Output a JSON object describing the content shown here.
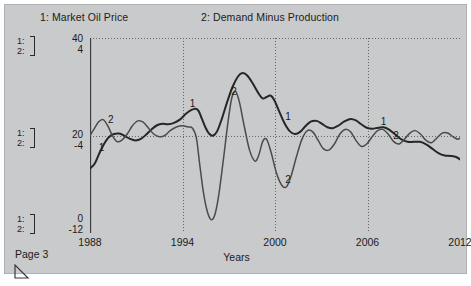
{
  "window": {
    "page_label": "Page 3",
    "resize_grip_icon": "resize-corner-icon",
    "background_color": "#c9cacb"
  },
  "legend": [
    {
      "key": "1",
      "label": "1: Market Oil Price"
    },
    {
      "key": "2",
      "label": "2: Demand Minus Production"
    }
  ],
  "scale_brackets": [
    {
      "line1": "1:",
      "line2": "2:"
    },
    {
      "line1": "1:",
      "line2": "2:"
    },
    {
      "line1": "1:",
      "line2": "2:"
    }
  ],
  "axis_values": {
    "top": {
      "scale1": "40",
      "scale2": "4"
    },
    "mid": {
      "scale1": "20",
      "scale2": "-4"
    },
    "bottom": {
      "scale1": "0",
      "scale2": "-12"
    }
  },
  "chart_data": {
    "type": "line",
    "title": "",
    "xlabel": "Years",
    "ylabel": "",
    "grid": true,
    "legend_position": "top",
    "x": [
      1988,
      2012
    ],
    "xlim": [
      1988,
      2012
    ],
    "xticks": [
      "1988",
      "1994",
      "2000",
      "2006",
      "2012"
    ],
    "xtick_values": [
      1988,
      1994,
      2000,
      2006,
      2012
    ],
    "axes": [
      {
        "id": "1",
        "name": "Market Oil Price",
        "ylim": [
          0,
          40
        ],
        "yticks": [
          0,
          20,
          40
        ],
        "ytick_labels": [
          "0",
          "20",
          "40"
        ],
        "color": "#262626"
      },
      {
        "id": "2",
        "name": "Demand Minus Production",
        "ylim": [
          -12,
          4
        ],
        "yticks": [
          -12,
          -4,
          4
        ],
        "ytick_labels": [
          "-12",
          "-4",
          "4"
        ],
        "color": "#4b4b4b"
      }
    ],
    "series": [
      {
        "name": "Market Oil Price",
        "key": "1",
        "axis": "1",
        "inline_tag": "1",
        "tag_positions_x": [
          1988.5,
          1994.4,
          2000.6,
          2006.8
        ],
        "points": [
          [
            1988.0,
            13.2
          ],
          [
            1988.3,
            14.2
          ],
          [
            1988.6,
            16.3
          ],
          [
            1988.9,
            18.2
          ],
          [
            1989.2,
            19.6
          ],
          [
            1989.55,
            20.3
          ],
          [
            1989.9,
            20.4
          ],
          [
            1990.25,
            19.9
          ],
          [
            1990.6,
            19.3
          ],
          [
            1990.95,
            19.0
          ],
          [
            1991.3,
            19.3
          ],
          [
            1991.65,
            20.2
          ],
          [
            1992.0,
            21.3
          ],
          [
            1992.35,
            22.1
          ],
          [
            1992.7,
            22.4
          ],
          [
            1993.05,
            22.3
          ],
          [
            1993.45,
            22.6
          ],
          [
            1993.85,
            23.3
          ],
          [
            1994.2,
            24.4
          ],
          [
            1994.55,
            25.2
          ],
          [
            1994.85,
            25.5
          ],
          [
            1995.05,
            25.0
          ],
          [
            1995.25,
            23.5
          ],
          [
            1995.5,
            21.6
          ],
          [
            1995.75,
            20.3
          ],
          [
            1996.0,
            20.0
          ],
          [
            1996.25,
            20.9
          ],
          [
            1996.55,
            23.4
          ],
          [
            1996.9,
            26.9
          ],
          [
            1997.25,
            30.0
          ],
          [
            1997.6,
            32.1
          ],
          [
            1997.9,
            32.8
          ],
          [
            1998.2,
            32.3
          ],
          [
            1998.55,
            30.7
          ],
          [
            1998.9,
            28.8
          ],
          [
            1999.2,
            27.6
          ],
          [
            1999.45,
            27.9
          ],
          [
            1999.7,
            28.2
          ],
          [
            1999.95,
            27.3
          ],
          [
            2000.25,
            25.1
          ],
          [
            2000.6,
            22.6
          ],
          [
            2000.95,
            20.9
          ],
          [
            2001.3,
            20.3
          ],
          [
            2001.65,
            20.8
          ],
          [
            2002.0,
            22.0
          ],
          [
            2002.35,
            22.9
          ],
          [
            2002.7,
            23.0
          ],
          [
            2003.05,
            22.4
          ],
          [
            2003.4,
            21.7
          ],
          [
            2003.75,
            21.5
          ],
          [
            2004.1,
            22.0
          ],
          [
            2004.5,
            22.9
          ],
          [
            2004.9,
            23.4
          ],
          [
            2005.25,
            23.1
          ],
          [
            2005.6,
            22.3
          ],
          [
            2005.95,
            21.6
          ],
          [
            2006.3,
            21.4
          ],
          [
            2006.7,
            21.6
          ],
          [
            2007.05,
            21.7
          ],
          [
            2007.4,
            21.2
          ],
          [
            2007.8,
            20.2
          ],
          [
            2008.2,
            19.2
          ],
          [
            2008.6,
            18.7
          ],
          [
            2009.0,
            18.7
          ],
          [
            2009.4,
            18.7
          ],
          [
            2009.8,
            18.2
          ],
          [
            2010.2,
            17.3
          ],
          [
            2010.6,
            16.4
          ],
          [
            2011.0,
            15.9
          ],
          [
            2011.4,
            15.8
          ],
          [
            2011.75,
            15.6
          ],
          [
            2012.0,
            15.1
          ]
        ]
      },
      {
        "name": "Demand Minus Production",
        "key": "2",
        "axis": "2",
        "inline_tag": "2",
        "tag_positions_x": [
          1989.1,
          1997.1,
          2000.6,
          2007.6
        ],
        "points": [
          [
            1988.0,
            -4.0
          ],
          [
            1988.25,
            -3.5
          ],
          [
            1988.55,
            -2.9
          ],
          [
            1988.85,
            -2.7
          ],
          [
            1989.15,
            -3.2
          ],
          [
            1989.45,
            -4.0
          ],
          [
            1989.75,
            -4.5
          ],
          [
            1990.05,
            -4.4
          ],
          [
            1990.4,
            -3.9
          ],
          [
            1990.75,
            -3.2
          ],
          [
            1991.1,
            -2.8
          ],
          [
            1991.45,
            -2.9
          ],
          [
            1991.8,
            -3.4
          ],
          [
            1992.15,
            -3.9
          ],
          [
            1992.5,
            -4.1
          ],
          [
            1992.85,
            -4.0
          ],
          [
            1993.2,
            -3.6
          ],
          [
            1993.6,
            -3.3
          ],
          [
            1994.0,
            -3.2
          ],
          [
            1994.35,
            -3.3
          ],
          [
            1994.65,
            -3.4
          ],
          [
            1994.9,
            -4.2
          ],
          [
            1995.1,
            -6.2
          ],
          [
            1995.35,
            -8.6
          ],
          [
            1995.6,
            -10.2
          ],
          [
            1995.85,
            -10.9
          ],
          [
            1996.1,
            -10.5
          ],
          [
            1996.35,
            -8.9
          ],
          [
            1996.65,
            -6.0
          ],
          [
            1996.95,
            -2.9
          ],
          [
            1997.2,
            -0.9
          ],
          [
            1997.45,
            -0.4
          ],
          [
            1997.7,
            -1.3
          ],
          [
            1998.0,
            -3.2
          ],
          [
            1998.35,
            -5.2
          ],
          [
            1998.7,
            -6.1
          ],
          [
            1998.95,
            -5.6
          ],
          [
            1999.2,
            -4.5
          ],
          [
            1999.45,
            -4.3
          ],
          [
            1999.75,
            -5.4
          ],
          [
            2000.1,
            -7.1
          ],
          [
            2000.45,
            -8.1
          ],
          [
            2000.75,
            -8.2
          ],
          [
            2001.05,
            -7.3
          ],
          [
            2001.4,
            -5.7
          ],
          [
            2001.75,
            -4.3
          ],
          [
            2002.1,
            -3.6
          ],
          [
            2002.45,
            -3.7
          ],
          [
            2002.8,
            -4.4
          ],
          [
            2003.15,
            -5.1
          ],
          [
            2003.5,
            -5.2
          ],
          [
            2003.85,
            -4.7
          ],
          [
            2004.2,
            -3.9
          ],
          [
            2004.55,
            -3.5
          ],
          [
            2004.9,
            -3.7
          ],
          [
            2005.25,
            -4.4
          ],
          [
            2005.6,
            -4.9
          ],
          [
            2005.95,
            -4.7
          ],
          [
            2006.3,
            -4.1
          ],
          [
            2006.65,
            -3.6
          ],
          [
            2007.0,
            -3.5
          ],
          [
            2007.35,
            -3.9
          ],
          [
            2007.7,
            -4.5
          ],
          [
            2008.05,
            -4.7
          ],
          [
            2008.4,
            -4.3
          ],
          [
            2008.75,
            -3.8
          ],
          [
            2009.1,
            -3.6
          ],
          [
            2009.45,
            -3.9
          ],
          [
            2009.8,
            -4.4
          ],
          [
            2010.15,
            -4.6
          ],
          [
            2010.5,
            -4.2
          ],
          [
            2010.85,
            -3.8
          ],
          [
            2011.2,
            -3.8
          ],
          [
            2011.55,
            -4.1
          ],
          [
            2011.85,
            -4.3
          ],
          [
            2012.0,
            -4.2
          ]
        ]
      }
    ]
  }
}
